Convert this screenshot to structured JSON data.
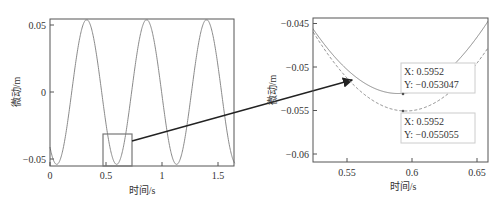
{
  "chart_data": [
    {
      "type": "line",
      "title": "",
      "xlabel": "时间/s",
      "ylabel": "微动/m",
      "xlim": [
        0,
        1.65
      ],
      "ylim": [
        -0.055,
        0.055
      ],
      "xticks": [
        "0",
        "0.5",
        "1",
        "1.5"
      ],
      "yticks": [
        "0.05",
        "0",
        "-0.05"
      ],
      "grid": false,
      "series": [
        {
          "name": "signal",
          "function": "-0.054*cos(2*pi*(t-0.06)/0.535)",
          "amplitude": 0.054,
          "period_s": 0.535,
          "peaks_x": [
            0.33,
            0.87,
            1.4
          ],
          "troughs_x": [
            0.06,
            0.595,
            1.13
          ]
        }
      ],
      "annotations": [
        {
          "type": "rect",
          "label": "zoom-region",
          "x": [
            0.48,
            0.74
          ],
          "y": [
            -0.055,
            -0.029
          ]
        }
      ]
    },
    {
      "type": "line",
      "title": "",
      "xlabel": "时间/s",
      "ylabel": "微动/m",
      "xlim": [
        0.525,
        0.658
      ],
      "ylim": [
        -0.0615,
        -0.0445
      ],
      "xticks": [
        "0.55",
        "0.6",
        "0.65"
      ],
      "yticks": [
        "-0.045",
        "-0.05",
        "-0.055",
        "-0.06"
      ],
      "grid": false,
      "series": [
        {
          "name": "solid",
          "style": "solid",
          "min_x": 0.5952,
          "min_y": -0.053047
        },
        {
          "name": "dashed",
          "style": "dashed",
          "min_x": 0.5952,
          "min_y": -0.055055
        }
      ],
      "datatips": [
        {
          "x_label": "X",
          "x_value": "0.5952",
          "y_label": "Y",
          "y_value": "−0.053047"
        },
        {
          "x_label": "X",
          "x_value": "0.5952",
          "y_label": "Y",
          "y_value": "−0.055055"
        }
      ]
    }
  ],
  "left": {
    "xlabel": "时间/s",
    "ylabel": "微动/m",
    "xticks": [
      {
        "v": 0,
        "t": "0"
      },
      {
        "v": 0.5,
        "t": "0.5"
      },
      {
        "v": 1,
        "t": "1"
      },
      {
        "v": 1.5,
        "t": "1.5"
      }
    ],
    "yticks": [
      {
        "v": 0.05,
        "t": "0.05"
      },
      {
        "v": 0,
        "t": "0"
      },
      {
        "v": -0.05,
        "t": "−0.05"
      }
    ]
  },
  "right": {
    "xlabel": "时间/s",
    "ylabel": "微动/m",
    "xticks": [
      {
        "v": 0.55,
        "t": "0.55"
      },
      {
        "v": 0.6,
        "t": "0.6"
      },
      {
        "v": 0.65,
        "t": "0.65"
      }
    ],
    "yticks": [
      {
        "v": -0.045,
        "t": "−0.045"
      },
      {
        "v": -0.05,
        "t": "−0.05"
      },
      {
        "v": -0.055,
        "t": "−0.055"
      },
      {
        "v": -0.06,
        "t": "−0.06"
      }
    ],
    "tip1": {
      "x": "X: 0.5952",
      "y": "Y: −0.053047"
    },
    "tip2": {
      "x": "X: 0.5952",
      "y": "Y: −0.055055"
    }
  },
  "colors": {
    "line": "#8a8a8a",
    "axis": "#555555",
    "arrow": "#222222",
    "tipbox": "#cccccc"
  }
}
